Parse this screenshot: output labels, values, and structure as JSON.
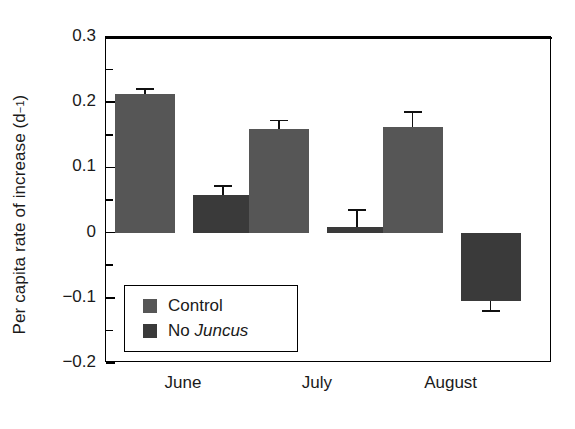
{
  "chart_data": {
    "type": "bar",
    "title": "",
    "xlabel": "",
    "ylabel": "Per capita rate of increase (d",
    "ylabel_superscript": "−1",
    "ylabel_suffix": ")",
    "categories": [
      "June",
      "July",
      "August"
    ],
    "series": [
      {
        "name": "Control",
        "color": "#565656",
        "values": [
          0.212,
          0.159,
          0.162
        ],
        "errors": [
          0.008,
          0.013,
          0.023
        ]
      },
      {
        "name": "No Juncus",
        "name_plain": "No ",
        "name_italic": "Juncus",
        "color": "#3a3a3a",
        "values": [
          0.058,
          0.008,
          -0.105
        ],
        "errors": [
          0.013,
          0.027,
          0.015
        ]
      }
    ],
    "ylim": [
      -0.2,
      0.3
    ],
    "ytick_major": [
      0.3,
      0.2,
      0.1,
      0,
      -0.1,
      -0.2
    ],
    "ytick_major_labels": [
      "0.3",
      "0.2",
      "0.1",
      "0",
      "−0.1",
      "−0.2"
    ],
    "ytick_minor": [
      0.25,
      0.15,
      0.05,
      -0.05,
      -0.15
    ],
    "grid": false,
    "legend_position": "inside-lower-left",
    "zero_line": true,
    "frame": true
  }
}
